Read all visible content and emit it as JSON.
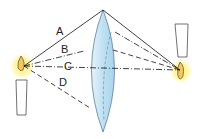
{
  "diagram": {
    "rays": [
      {
        "id": "A",
        "label": "A",
        "style": "solid"
      },
      {
        "id": "B",
        "label": "B",
        "style": "dash-dot"
      },
      {
        "id": "C",
        "label": "C",
        "style": "dash-dot"
      },
      {
        "id": "D",
        "label": "D",
        "style": "dashed"
      }
    ],
    "objects": {
      "object_candle": "upright candle (object)",
      "image_candle": "inverted candle (image)",
      "lens": "convex lens"
    },
    "colors": {
      "lens_fill": "#bfe0f2",
      "lens_edge": "#5a7f9a",
      "flame_glow": "#fff27a",
      "ray": "#111111"
    }
  }
}
